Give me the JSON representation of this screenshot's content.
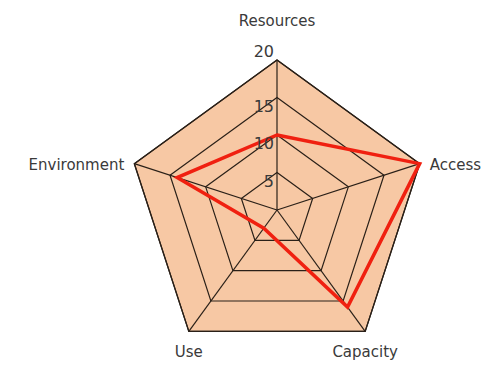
{
  "chart_data": {
    "type": "radar",
    "title": "",
    "categories": [
      "Resources",
      "Access",
      "Capacity",
      "Use",
      "Environment"
    ],
    "series": [
      {
        "name": "Score",
        "values": [
          10,
          20,
          16,
          3,
          14
        ],
        "color": "#f02010"
      }
    ],
    "rlim": [
      0,
      20
    ],
    "ticks": [
      5,
      10,
      15,
      20
    ],
    "tick_labels": [
      "5",
      "10",
      "15",
      "20"
    ],
    "grid": true,
    "fill_color": "#f7c8a4",
    "grid_color": "#2a2018"
  }
}
